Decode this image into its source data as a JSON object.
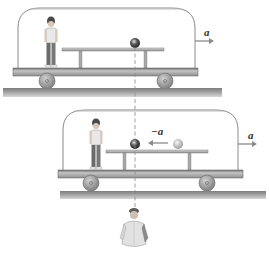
{
  "figure": {
    "colors": {
      "background": "#ffffff",
      "dome_outline": "#8a8a8a",
      "cart_base": "#a9a9a9",
      "cart_base_dark": "#6e6e6e",
      "ground": "#9a9a9a",
      "wheel": "#8c8c8c",
      "table": "#b5b5b5",
      "ball_dark": "#3a3a3a",
      "ball_light": "#bdbdbd",
      "arrow": "#8a8a8a",
      "dashed_line": "#888888"
    },
    "panel_top": {
      "acceleration_label": "a",
      "arrow_direction": "right"
    },
    "panel_bottom": {
      "acceleration_label": "a",
      "ball_relative_acceleration_label": "−a",
      "ball_arrow_direction": "left"
    },
    "observer": {
      "description": "ground observer"
    }
  }
}
